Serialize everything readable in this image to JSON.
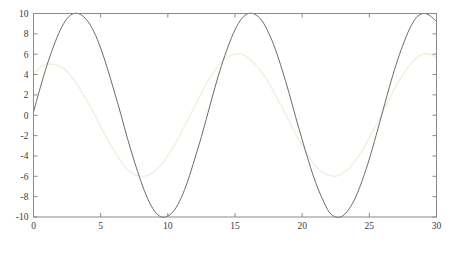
{
  "chart_data": {
    "type": "line",
    "title": "",
    "xlabel": "",
    "ylabel": "",
    "xlim": [
      0,
      30
    ],
    "ylim": [
      -10,
      10
    ],
    "grid": false,
    "legend": "none",
    "xticks": [
      0,
      5,
      10,
      15,
      20,
      25,
      30
    ],
    "xtick_labels": [
      "0",
      "5",
      "10",
      "15",
      "20",
      "25",
      "30"
    ],
    "yticks": [
      -10,
      -8,
      -6,
      -4,
      -2,
      0,
      2,
      4,
      6,
      8,
      10
    ],
    "ytick_labels": [
      "-10",
      "-8",
      "-6",
      "-4",
      "-2",
      "0",
      "2",
      "4",
      "6",
      "8",
      "10"
    ],
    "series": [
      {
        "name": "series-dark",
        "color": "#6b6b6b",
        "linewidth": 1.0,
        "amplitude": 10,
        "period": 12.5,
        "phase_x0_value": 0.3,
        "peaks_x": [
          3.2,
          15.6,
          28.1
        ],
        "troughs_x": [
          9.4,
          21.9
        ],
        "x": [
          0,
          0.5,
          1,
          1.5,
          2,
          2.5,
          3,
          3.5,
          4,
          4.5,
          5,
          5.5,
          6,
          6.5,
          7,
          7.5,
          8,
          8.5,
          9,
          9.5,
          10,
          10.5,
          11,
          11.5,
          12,
          12.5,
          13,
          13.5,
          14,
          14.5,
          15,
          15.5,
          16,
          16.5,
          17,
          17.5,
          18,
          18.5,
          19,
          19.5,
          20,
          20.5,
          21,
          21.5,
          22,
          22.5,
          23,
          23.5,
          24,
          24.5,
          25,
          25.5,
          26,
          26.5,
          27,
          27.5,
          28,
          28.5,
          29,
          29.5,
          30
        ],
        "y": [
          0.3,
          2.7,
          4.9,
          6.8,
          8.4,
          9.5,
          10.0,
          9.9,
          9.3,
          8.2,
          6.6,
          4.6,
          2.4,
          0.1,
          -2.3,
          -4.5,
          -6.5,
          -8.2,
          -9.4,
          -10.0,
          -9.9,
          -9.3,
          -8.1,
          -6.4,
          -4.3,
          -2.1,
          0.3,
          2.7,
          4.9,
          6.8,
          8.4,
          9.5,
          10.0,
          9.9,
          9.3,
          8.1,
          6.5,
          4.5,
          2.3,
          -0.1,
          -2.4,
          -4.6,
          -6.6,
          -8.2,
          -9.5,
          -10.0,
          -9.9,
          -9.2,
          -8.0,
          -6.3,
          -4.3,
          -2.0,
          0.4,
          2.8,
          5.0,
          6.9,
          8.5,
          9.6,
          10.0,
          9.8,
          9.2
        ],
        "y_at_x30": 9.2
      },
      {
        "name": "series-light",
        "color": "#f3eedd",
        "linewidth": 1.4,
        "amplitude": 6,
        "period": 12.5,
        "phase_x0_value": 4.0,
        "peaks_x": [
          1.3,
          13.5,
          26.0
        ],
        "troughs_x": [
          7.5,
          19.8
        ],
        "x": [
          0,
          0.5,
          1,
          1.5,
          2,
          2.5,
          3,
          3.5,
          4,
          4.5,
          5,
          5.5,
          6,
          6.5,
          7,
          7.5,
          8,
          8.5,
          9,
          9.5,
          10,
          10.5,
          11,
          11.5,
          12,
          12.5,
          13,
          13.5,
          14,
          14.5,
          15,
          15.5,
          16,
          16.5,
          17,
          17.5,
          18,
          18.5,
          19,
          19.5,
          20,
          20.5,
          21,
          21.5,
          22,
          22.5,
          23,
          23.5,
          24,
          24.5,
          25,
          25.5,
          26,
          26.5,
          27,
          27.5,
          28,
          28.5,
          29,
          29.5,
          30
        ],
        "y": [
          4.0,
          4.7,
          5.0,
          5.0,
          4.8,
          4.3,
          3.5,
          2.5,
          1.4,
          0.2,
          -1.1,
          -2.4,
          -3.5,
          -4.5,
          -5.3,
          -5.8,
          -6.0,
          -5.9,
          -5.5,
          -4.9,
          -4.0,
          -2.9,
          -1.7,
          -0.4,
          0.9,
          2.2,
          3.4,
          4.4,
          5.2,
          5.8,
          6.0,
          6.0,
          5.6,
          5.0,
          4.2,
          3.2,
          2.0,
          0.8,
          -0.5,
          -1.8,
          -3.0,
          -4.1,
          -5.0,
          -5.6,
          -5.9,
          -6.0,
          -5.7,
          -5.2,
          -4.4,
          -3.4,
          -2.2,
          -1.0,
          0.3,
          1.6,
          2.9,
          4.0,
          4.9,
          5.6,
          6.0,
          6.0,
          5.7
        ],
        "y_at_x30": 5.7
      }
    ]
  },
  "axes": {
    "box_color": "#8a8a8a",
    "tick_color": "#8a8a8a",
    "background": "#ffffff"
  }
}
